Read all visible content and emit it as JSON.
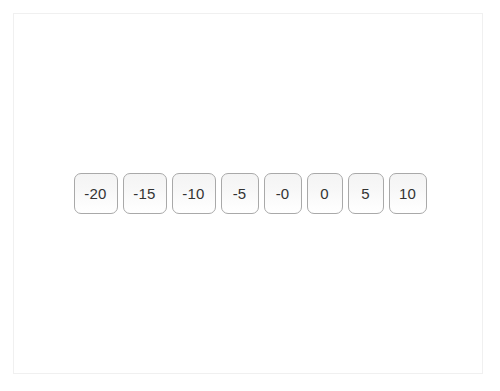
{
  "page": {
    "background_color": "#ffffff",
    "frame_border_color": "#f0f0f0"
  },
  "button_row": {
    "name": "number-button-row",
    "button_border_color": "#a9a9a9",
    "button_text_color": "#333333",
    "button_background_top": "#f4f4f4",
    "button_background_bottom": "#ffffff",
    "buttons": [
      {
        "label": "-20",
        "value": -20,
        "width_class": "w3"
      },
      {
        "label": "-15",
        "value": -15,
        "width_class": "w3"
      },
      {
        "label": "-10",
        "value": -10,
        "width_class": "w3"
      },
      {
        "label": "-5",
        "value": -5,
        "width_class": "w2"
      },
      {
        "label": "-0",
        "value": 0,
        "width_class": "w2"
      },
      {
        "label": "0",
        "value": 0,
        "width_class": "w1"
      },
      {
        "label": "5",
        "value": 5,
        "width_class": "w1"
      },
      {
        "label": "10",
        "value": 10,
        "width_class": "w2"
      }
    ]
  }
}
